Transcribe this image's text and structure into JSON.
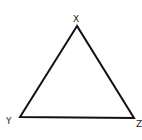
{
  "diagram": {
    "type": "triangle",
    "vertices": [
      {
        "id": "X",
        "label": "X"
      },
      {
        "id": "Y",
        "label": "Y"
      },
      {
        "id": "Z",
        "label": "Z"
      }
    ],
    "edges": [
      {
        "from": "X",
        "to": "Y"
      },
      {
        "from": "Y",
        "to": "Z"
      },
      {
        "from": "Z",
        "to": "X"
      }
    ],
    "stroke_color": "#111111",
    "label_color": "#222222"
  }
}
